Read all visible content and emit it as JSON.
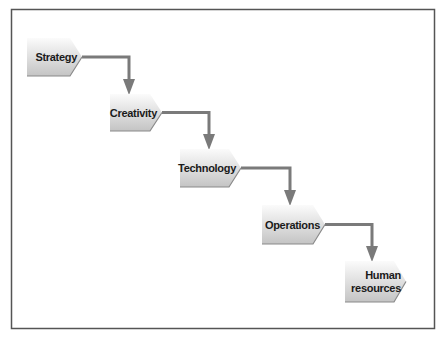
{
  "diagram": {
    "type": "staircase-flow",
    "steps": [
      {
        "id": "strategy",
        "label_lines": [
          "Strategy"
        ]
      },
      {
        "id": "creativity",
        "label_lines": [
          "Creativity"
        ]
      },
      {
        "id": "technology",
        "label_lines": [
          "Technology"
        ]
      },
      {
        "id": "operations",
        "label_lines": [
          "Operations"
        ]
      },
      {
        "id": "human-resources",
        "label_lines": [
          "Human",
          "resources"
        ]
      }
    ],
    "connections": [
      {
        "from": "strategy",
        "to": "creativity"
      },
      {
        "from": "creativity",
        "to": "technology"
      },
      {
        "from": "technology",
        "to": "operations"
      },
      {
        "from": "operations",
        "to": "human-resources"
      }
    ],
    "colors": {
      "frame": "#555555",
      "connector": "#7a7a7a",
      "shape_top": "#fbfbfb",
      "shape_bottom": "#c4c4c4",
      "shape_edge": "#8a8a8a",
      "text": "#1a1a1a"
    }
  }
}
